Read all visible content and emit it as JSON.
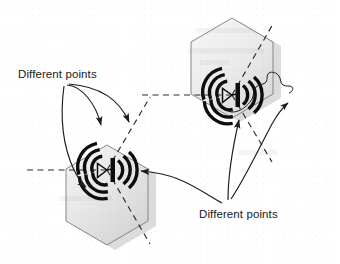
{
  "figure": {
    "background_color": "#ffffff",
    "cell_fill_start": "#f0f0f0",
    "cell_fill_end": "#d7d7d7",
    "cell_stroke": "#6e6e6e",
    "dashed_stroke": "#2b2b2b",
    "arrow_stroke": "#1c1c1c",
    "antenna_color": "#0d0d0d",
    "shadow_color": "#c9c9c9"
  },
  "labels": {
    "top_left": {
      "text": "Different points",
      "x": 18,
      "y": 78
    },
    "bottom_right": {
      "text": "Different points",
      "x": 199,
      "y": 218
    }
  },
  "cells": [
    {
      "name": "left-cell",
      "center_x": 107,
      "center_y": 170,
      "radius": 81,
      "antenna_x": 107,
      "antenna_y": 170
    },
    {
      "name": "right-cell",
      "center_x": 232,
      "center_y": 95,
      "radius": 81,
      "antenna_x": 232,
      "antenna_y": 95
    }
  ],
  "annotations": {
    "top_left_arrow_count": 3,
    "bottom_right_arrow_count": 2,
    "coverage_blob": "irregular coverage outline"
  }
}
